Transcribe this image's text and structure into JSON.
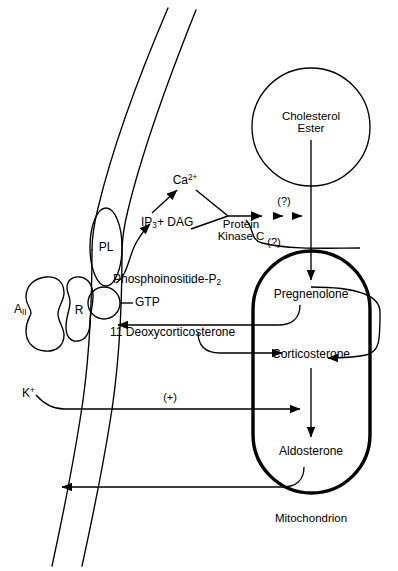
{
  "figure": {
    "type": "biological-pathway-diagram"
  },
  "labels": {
    "a2": "A",
    "a2_sub": "II",
    "receptor": "R",
    "pl": "PL",
    "gtp": "GTP",
    "ip3": "IP",
    "ip3_sub": "3",
    "ip3_tail": "+ DAG",
    "calcium": "Ca",
    "calcium_sup": "2+",
    "pkc_line1": "Protein",
    "pkc_line2": "Kinase C",
    "pip2": "Phosphoinositide-P",
    "pip2_sub": "2",
    "cholesterol_line1": "Cholesterol",
    "cholesterol_line2": "Ester",
    "question1": "(?)",
    "question2": "(?)",
    "pregnenolone": "Pregnenolone",
    "deoxycorticosterone": "11 Deoxycorticosterone",
    "corticosterone": "Corticosterone",
    "aldosterone": "Aldosterone",
    "potassium": "K",
    "potassium_sup": "+",
    "plus_sign": "(+)",
    "mitochondrion": "Mitochondrion"
  },
  "colors": {
    "ink": "#000000",
    "background": "#ffffff"
  }
}
